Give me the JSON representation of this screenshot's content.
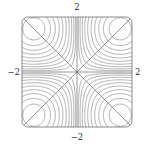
{
  "figure": {
    "kind": "contour-plot",
    "background_color": "#ffffff",
    "width": 154,
    "height": 152
  },
  "frame": {
    "left": 22,
    "top": 17,
    "right": 132,
    "bottom": 127,
    "corner_radius": 6,
    "stroke_color": "#6e6e6e",
    "stroke_width": 0.8
  },
  "axes": {
    "top_label": "2",
    "bottom_label": "−2",
    "left_label": "−2",
    "right_label": "2",
    "label_color": "#2b2b2b"
  },
  "chart_data": {
    "type": "contour",
    "title": "",
    "xlabel": "",
    "ylabel": "",
    "xlim": [
      -2,
      2
    ],
    "ylim": [
      -2,
      2
    ],
    "xticks": [
      -2,
      2
    ],
    "yticks": [
      -2,
      2
    ],
    "xtick_labels": [
      "−2",
      "2"
    ],
    "ytick_labels": [
      "−2",
      "2"
    ],
    "grid": false,
    "legend": null,
    "function": "z = sin(x) * sin(y)",
    "zero_level_curves": [
      {
        "name": "horizontal-axis",
        "points": [
          [
            -2,
            0
          ],
          [
            2,
            0
          ]
        ]
      },
      {
        "name": "vertical-axis",
        "points": [
          [
            0,
            -2
          ],
          [
            0,
            2
          ]
        ]
      },
      {
        "name": "diagonal-up",
        "points": [
          [
            -2,
            -2
          ],
          [
            2,
            2
          ]
        ]
      },
      {
        "name": "diagonal-down",
        "points": [
          [
            -2,
            2
          ],
          [
            2,
            -2
          ]
        ]
      }
    ],
    "contour_levels": [
      -0.92,
      -0.82,
      -0.71,
      -0.6,
      -0.49,
      -0.38,
      -0.28,
      -0.19,
      -0.11,
      -0.05,
      0.05,
      0.11,
      0.19,
      0.28,
      0.38,
      0.49,
      0.6,
      0.71,
      0.82,
      0.92
    ],
    "extrema": [
      {
        "location": [
          -1.57,
          -1.57
        ],
        "value": 1.0,
        "type": "maximum"
      },
      {
        "location": [
          1.57,
          1.57
        ],
        "value": 1.0,
        "type": "maximum"
      },
      {
        "location": [
          -1.57,
          1.57
        ],
        "value": -1.0,
        "type": "minimum"
      },
      {
        "location": [
          1.57,
          -1.57
        ],
        "value": -1.0,
        "type": "minimum"
      },
      {
        "location": [
          0,
          0
        ],
        "value": 0.0,
        "type": "saddle"
      }
    ],
    "contour_line_color": "#707070",
    "contour_line_width": 0.55,
    "axis_line_color": "#6a6a6a",
    "axis_line_width": 0.7,
    "contours_per_corner": 10
  }
}
